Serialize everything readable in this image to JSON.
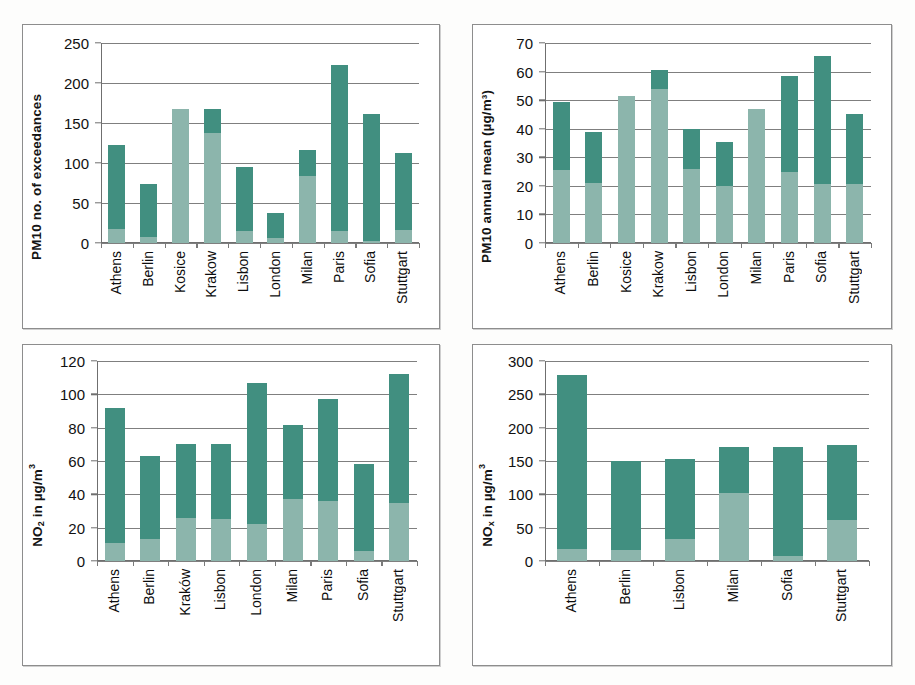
{
  "figure": {
    "panels": [
      "pm10_exceedances",
      "pm10_annual_mean",
      "no2",
      "nox"
    ]
  },
  "chart_data": [
    {
      "id": "pm10_exceedances",
      "type": "bar",
      "stacked": true,
      "title": "",
      "xlabel": "",
      "ylabel": "PM10 no. of exceedances",
      "ylim": [
        0,
        250
      ],
      "yticks": [
        0,
        50,
        100,
        150,
        200,
        250
      ],
      "ytick_labels": [
        "0",
        "50",
        "100",
        "150",
        "200",
        "250"
      ],
      "grid": true,
      "legend": "none",
      "categories": [
        "Athens",
        "Berlin",
        "Kosice",
        "Krakow",
        "Lisbon",
        "London",
        "Milan",
        "Paris",
        "Sofia",
        "Stuttgart"
      ],
      "series": [
        {
          "name": "lower",
          "color": "#8cb5ac",
          "values": [
            17,
            8,
            167,
            137,
            15,
            6,
            84,
            15,
            2,
            16
          ]
        },
        {
          "name": "upper",
          "color": "#418f80",
          "values": [
            122,
            74,
            167,
            167,
            95,
            37,
            116,
            223,
            161,
            113
          ]
        }
      ]
    },
    {
      "id": "pm10_annual_mean",
      "type": "bar",
      "stacked": true,
      "title": "",
      "xlabel": "",
      "ylabel": "PM10 annual mean (µg/m³)",
      "ylim": [
        0,
        70
      ],
      "yticks": [
        0,
        10,
        20,
        30,
        40,
        50,
        60,
        70
      ],
      "ytick_labels": [
        "0",
        "10",
        "20",
        "30",
        "40",
        "50",
        "60",
        "70"
      ],
      "grid": true,
      "legend": "none",
      "categories": [
        "Athens",
        "Berlin",
        "Kosice",
        "Krakow",
        "Lisbon",
        "London",
        "Milan",
        "Paris",
        "Sofia",
        "Stuttgart"
      ],
      "series": [
        {
          "name": "lower",
          "color": "#8cb5ac",
          "values": [
            25.5,
            21,
            51.5,
            54,
            26,
            20,
            47,
            25,
            20.5,
            20.5
          ]
        },
        {
          "name": "upper",
          "color": "#418f80",
          "values": [
            49.5,
            39,
            51.5,
            60.5,
            40,
            35.5,
            47,
            58.5,
            65.5,
            45
          ]
        }
      ]
    },
    {
      "id": "no2",
      "type": "bar",
      "stacked": true,
      "title": "",
      "xlabel": "",
      "ylabel": "NO2 in µg/m³",
      "ylim": [
        0,
        120
      ],
      "yticks": [
        0,
        20,
        40,
        60,
        80,
        100,
        120
      ],
      "ytick_labels": [
        "0",
        "20",
        "40",
        "60",
        "80",
        "100",
        "120"
      ],
      "grid": true,
      "legend": "none",
      "categories": [
        "Athens",
        "Berlin",
        "Kraków",
        "Lisbon",
        "London",
        "Milan",
        "Paris",
        "Sofia",
        "Stuttgart"
      ],
      "series": [
        {
          "name": "lower",
          "color": "#8cb5ac",
          "values": [
            11,
            13,
            26,
            25,
            22,
            37,
            36,
            6,
            35
          ]
        },
        {
          "name": "upper",
          "color": "#418f80",
          "values": [
            92,
            63,
            70.5,
            70,
            107,
            81.5,
            97,
            58,
            112.5
          ]
        }
      ]
    },
    {
      "id": "nox",
      "type": "bar",
      "stacked": true,
      "title": "",
      "xlabel": "",
      "ylabel": "NOx in µg/m³",
      "ylim": [
        0,
        300
      ],
      "yticks": [
        0,
        50,
        100,
        150,
        200,
        250,
        300
      ],
      "ytick_labels": [
        "0",
        "50",
        "100",
        "150",
        "200",
        "250",
        "300"
      ],
      "grid": true,
      "legend": "none",
      "categories": [
        "Athens",
        "Berlin",
        "Lisbon",
        "Milan",
        "Sofia",
        "Stuttgart"
      ],
      "series": [
        {
          "name": "lower",
          "color": "#8cb5ac",
          "values": [
            18,
            16,
            33,
            102,
            7,
            61
          ]
        },
        {
          "name": "upper",
          "color": "#418f80",
          "values": [
            279,
            150,
            153,
            171,
            171,
            174
          ]
        }
      ]
    }
  ],
  "axis_titles": {
    "pm10_exceedances": {
      "text": "PM10 no. of exceedances"
    },
    "pm10_annual_mean": {
      "text": "PM10 annual mean (µg/m³)"
    },
    "no2": {
      "main": "NO",
      "sub": "2",
      "tail": " in µg/m",
      "sup": "3"
    },
    "nox": {
      "main": "NO",
      "sub": "x",
      "tail": " in µg/m",
      "sup": "3"
    }
  },
  "colors": {
    "dark_green": "#418f80",
    "light_green": "#8cb5ac",
    "grid": "#7f7f7f",
    "frame": "#8d8d8d",
    "text": "#111111",
    "background": "#ffffff"
  }
}
